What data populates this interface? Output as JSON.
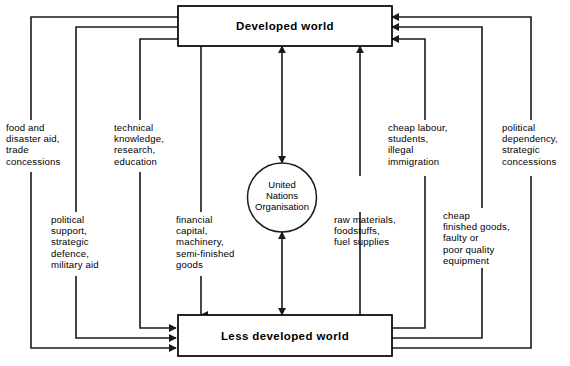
{
  "diagram": {
    "nodes": {
      "top_box": {
        "label": "Developed world"
      },
      "bottom_box": {
        "label": "Less developed world"
      },
      "centre_circle": {
        "line1": "United",
        "line2": "Nations",
        "line3": "Organisation"
      }
    },
    "colors": {
      "stroke": "#1a1a1a",
      "box_stroke": "#000000",
      "background": "#ffffff",
      "text": "#000000"
    },
    "flows_down": [
      {
        "id": "food-and-disaster-aid",
        "text": "food and\ndisaster aid,\ntrade\nconcessions"
      },
      {
        "id": "political-support",
        "text": "political\nsupport,\nstrategic\ndefence,\nmilitary aid"
      },
      {
        "id": "technical-knowledge",
        "text": "technical\nknowledge,\nresearch,\neducation"
      },
      {
        "id": "financial-capital",
        "text": "financial\ncapital,\nmachinery,\nsemi-finished\ngoods"
      }
    ],
    "flows_up": [
      {
        "id": "raw-materials",
        "text": "raw materials,\nfoodstuffs,\nfuel supplies"
      },
      {
        "id": "cheap-labour",
        "text": "cheap labour,\nstudents,\nillegal\nimmigration"
      },
      {
        "id": "cheap-finished-goods",
        "text": "cheap\nfinished goods,\nfaulty or\npoor quality\nequipment"
      },
      {
        "id": "political-dependency",
        "text": "political\ndependency,\nstrategic\nconcessions"
      }
    ]
  }
}
